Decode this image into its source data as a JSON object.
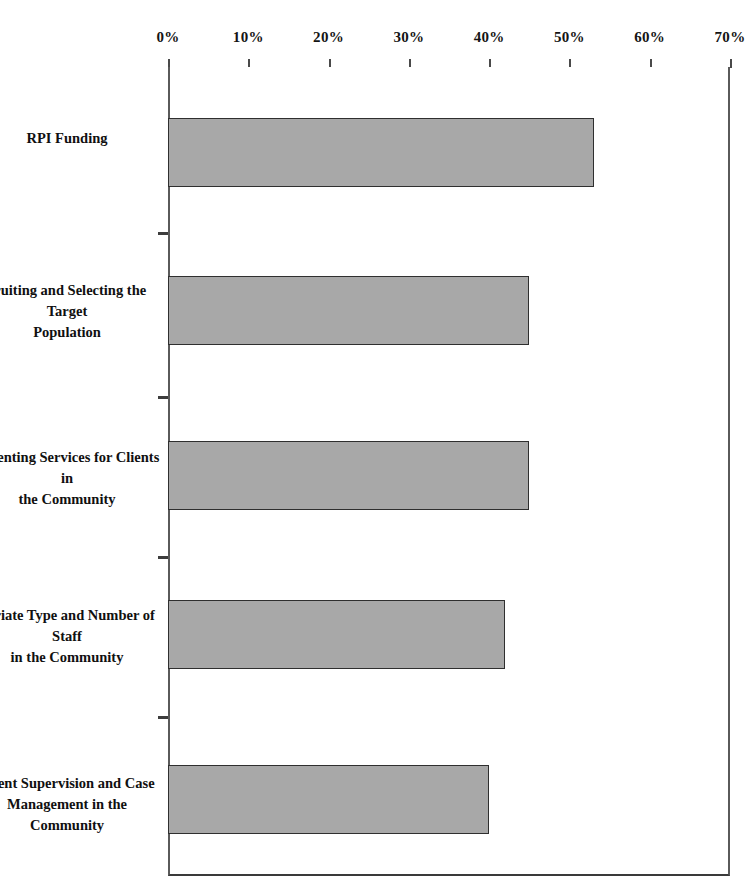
{
  "chart_data": {
    "type": "bar",
    "orientation": "horizontal",
    "title": "",
    "subtitle": "",
    "xlabel": "",
    "ylabel": "",
    "xlim": [
      0,
      70
    ],
    "xtick_labels": [
      "0%",
      "10%",
      "20%",
      "30%",
      "40%",
      "50%",
      "60%",
      "70%"
    ],
    "xtick_values": [
      0,
      10,
      20,
      30,
      40,
      50,
      60,
      70
    ],
    "grid": false,
    "legend": false,
    "value_suffix": "%",
    "categories": [
      "RPI Funding",
      "cruiting and Selecting the Target\nPopulation",
      "lementing Services for Clients in\nthe Community",
      "opriate Type and Number of Staff\nin the Community",
      "Client Supervision and Case\nManagement in the Community"
    ],
    "values": [
      53,
      45,
      45,
      42,
      40
    ],
    "series": [
      {
        "name": "",
        "values": [
          53,
          45,
          45,
          42,
          40
        ]
      }
    ],
    "colors": {
      "bar_fill": "#a8a8a8",
      "bar_border": "#2f2f2f",
      "axis": "#4a4a4a",
      "frame": "#5a5a5a",
      "text": "#101010",
      "background": "#ffffff"
    }
  },
  "axis": {
    "ticks": [
      {
        "label": "0%",
        "value": 0
      },
      {
        "label": "10%",
        "value": 10
      },
      {
        "label": "20%",
        "value": 20
      },
      {
        "label": "30%",
        "value": 30
      },
      {
        "label": "40%",
        "value": 40
      },
      {
        "label": "50%",
        "value": 50
      },
      {
        "label": "60%",
        "value": 60
      },
      {
        "label": "70%",
        "value": 70
      }
    ]
  },
  "bars": [
    {
      "label": "RPI Funding",
      "value": 53
    },
    {
      "label": "cruiting and Selecting the Target\nPopulation",
      "value": 45
    },
    {
      "label": "lementing Services for Clients in\nthe Community",
      "value": 45
    },
    {
      "label": "opriate Type and Number of Staff\nin the Community",
      "value": 42
    },
    {
      "label": "Client Supervision and Case\nManagement in the Community",
      "value": 40
    }
  ]
}
